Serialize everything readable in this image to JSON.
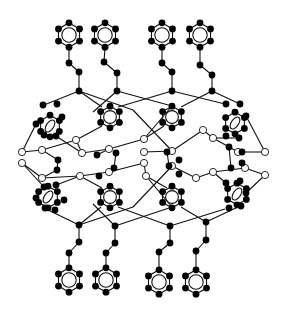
{
  "diagram": {
    "title": "",
    "width": 287,
    "height": 312,
    "colors": {
      "bond": "#111111",
      "filled_atom": "#000000",
      "open_atom": "#ffffff"
    },
    "benzene_rings": [
      {
        "id": "top1",
        "cx": 69,
        "cy": 35,
        "r": 9
      },
      {
        "id": "top2",
        "cx": 105,
        "cy": 35,
        "r": 9
      },
      {
        "id": "top3",
        "cx": 162,
        "cy": 35,
        "r": 9
      },
      {
        "id": "top4",
        "cx": 200,
        "cy": 35,
        "r": 9
      },
      {
        "id": "up-L",
        "cx": 50,
        "cy": 126,
        "r": 8,
        "tilt": true
      },
      {
        "id": "up-C1",
        "cx": 110,
        "cy": 117,
        "r": 8
      },
      {
        "id": "up-C2",
        "cx": 172,
        "cy": 117,
        "r": 8
      },
      {
        "id": "up-R",
        "cx": 235,
        "cy": 123,
        "r": 8,
        "tilt": true
      },
      {
        "id": "lo-L",
        "cx": 48,
        "cy": 197,
        "r": 8,
        "tilt": true
      },
      {
        "id": "lo-C1",
        "cx": 110,
        "cy": 197,
        "r": 8
      },
      {
        "id": "lo-C2",
        "cx": 172,
        "cy": 197,
        "r": 8
      },
      {
        "id": "lo-R",
        "cx": 237,
        "cy": 194,
        "r": 8,
        "tilt": true
      },
      {
        "id": "bot1",
        "cx": 69,
        "cy": 280,
        "r": 9
      },
      {
        "id": "bot2",
        "cx": 106,
        "cy": 280,
        "r": 9
      },
      {
        "id": "bot3",
        "cx": 159,
        "cy": 282,
        "r": 9
      },
      {
        "id": "bot4",
        "cx": 196,
        "cy": 282,
        "r": 9
      }
    ],
    "chains": [
      [
        [
          69,
          48
        ],
        [
          69,
          63
        ],
        [
          79,
          72
        ],
        [
          79,
          91
        ]
      ],
      [
        [
          105,
          48
        ],
        [
          104,
          62
        ],
        [
          117,
          73
        ],
        [
          117,
          91
        ]
      ],
      [
        [
          162,
          48
        ],
        [
          162,
          63
        ],
        [
          172,
          72
        ],
        [
          172,
          91
        ]
      ],
      [
        [
          200,
          48
        ],
        [
          200,
          65
        ],
        [
          212,
          75
        ],
        [
          212,
          91
        ]
      ],
      [
        [
          69,
          267
        ],
        [
          69,
          253
        ],
        [
          79,
          242
        ],
        [
          79,
          225
        ]
      ],
      [
        [
          106,
          267
        ],
        [
          106,
          253
        ],
        [
          115,
          243
        ],
        [
          115,
          226
        ]
      ],
      [
        [
          159,
          269
        ],
        [
          159,
          252
        ],
        [
          170,
          243
        ],
        [
          170,
          226
        ]
      ],
      [
        [
          196,
          269
        ],
        [
          196,
          251
        ],
        [
          206,
          240
        ],
        [
          206,
          222
        ]
      ]
    ],
    "open_atoms": [
      [
        22,
        152
      ],
      [
        42,
        150
      ],
      [
        76,
        140
      ],
      [
        82,
        153
      ],
      [
        109,
        149
      ],
      [
        144,
        139
      ],
      [
        144,
        152
      ],
      [
        172,
        151
      ],
      [
        203,
        130
      ],
      [
        213,
        138
      ],
      [
        238,
        152
      ],
      [
        265,
        152
      ],
      [
        22,
        163
      ],
      [
        42,
        178
      ],
      [
        80,
        176
      ],
      [
        109,
        172
      ],
      [
        144,
        163
      ],
      [
        146,
        176
      ],
      [
        172,
        166
      ],
      [
        196,
        178
      ],
      [
        213,
        172
      ],
      [
        245,
        168
      ],
      [
        265,
        175
      ]
    ],
    "filled_atoms": [
      [
        43,
        105
      ],
      [
        57,
        104
      ],
      [
        62,
        117
      ],
      [
        36,
        124
      ],
      [
        44,
        135
      ],
      [
        56,
        136
      ],
      [
        58,
        160
      ],
      [
        57,
        170
      ],
      [
        97,
        155
      ],
      [
        116,
        153
      ],
      [
        99,
        176
      ],
      [
        114,
        168
      ],
      [
        167,
        152
      ],
      [
        179,
        160
      ],
      [
        169,
        166
      ],
      [
        179,
        174
      ],
      [
        229,
        147
      ],
      [
        242,
        152
      ],
      [
        231,
        168
      ],
      [
        242,
        163
      ],
      [
        226,
        104
      ],
      [
        240,
        104
      ],
      [
        246,
        116
      ],
      [
        226,
        136
      ],
      [
        239,
        138
      ],
      [
        44,
        187
      ],
      [
        56,
        185
      ],
      [
        36,
        198
      ],
      [
        45,
        208
      ],
      [
        55,
        210
      ],
      [
        64,
        200
      ],
      [
        226,
        183
      ],
      [
        240,
        181
      ],
      [
        246,
        193
      ],
      [
        229,
        208
      ],
      [
        241,
        206
      ]
    ],
    "framework_bonds": [
      [
        [
          79,
          91
        ],
        [
          44,
          105
        ]
      ],
      [
        [
          79,
          91
        ],
        [
          102,
          107
        ]
      ],
      [
        [
          79,
          91
        ],
        [
          133,
          110
        ]
      ],
      [
        [
          117,
          91
        ],
        [
          93,
          112
        ]
      ],
      [
        [
          117,
          91
        ],
        [
          172,
          106
        ]
      ],
      [
        [
          172,
          91
        ],
        [
          118,
          107
        ]
      ],
      [
        [
          172,
          91
        ],
        [
          225,
          104
        ]
      ],
      [
        [
          212,
          91
        ],
        [
          181,
          107
        ]
      ],
      [
        [
          212,
          91
        ],
        [
          240,
          104
        ]
      ],
      [
        [
          79,
          225
        ],
        [
          44,
          208
        ]
      ],
      [
        [
          79,
          225
        ],
        [
          101,
          207
        ]
      ],
      [
        [
          79,
          225
        ],
        [
          133,
          207
        ]
      ],
      [
        [
          115,
          226
        ],
        [
          93,
          204
        ]
      ],
      [
        [
          115,
          226
        ],
        [
          172,
          207
        ]
      ],
      [
        [
          170,
          226
        ],
        [
          118,
          207
        ]
      ],
      [
        [
          170,
          226
        ],
        [
          225,
          209
        ]
      ],
      [
        [
          206,
          222
        ],
        [
          181,
          207
        ]
      ],
      [
        [
          206,
          222
        ],
        [
          240,
          206
        ]
      ],
      [
        [
          22,
          152
        ],
        [
          36,
          124
        ]
      ],
      [
        [
          22,
          152
        ],
        [
          42,
          150
        ]
      ],
      [
        [
          42,
          150
        ],
        [
          58,
          160
        ]
      ],
      [
        [
          42,
          150
        ],
        [
          76,
          140
        ]
      ],
      [
        [
          76,
          140
        ],
        [
          102,
          126
        ]
      ],
      [
        [
          76,
          140
        ],
        [
          82,
          153
        ]
      ],
      [
        [
          82,
          153
        ],
        [
          109,
          149
        ]
      ],
      [
        [
          109,
          149
        ],
        [
          144,
          139
        ]
      ],
      [
        [
          144,
          139
        ],
        [
          164,
          126
        ]
      ],
      [
        [
          144,
          152
        ],
        [
          172,
          151
        ]
      ],
      [
        [
          109,
          149
        ],
        [
          97,
          155
        ]
      ],
      [
        [
          172,
          151
        ],
        [
          203,
          130
        ]
      ],
      [
        [
          203,
          130
        ],
        [
          213,
          138
        ]
      ],
      [
        [
          213,
          138
        ],
        [
          238,
          152
        ]
      ],
      [
        [
          238,
          152
        ],
        [
          265,
          152
        ]
      ],
      [
        [
          265,
          152
        ],
        [
          246,
          116
        ]
      ],
      [
        [
          22,
          163
        ],
        [
          42,
          178
        ]
      ],
      [
        [
          22,
          163
        ],
        [
          44,
          187
        ]
      ],
      [
        [
          42,
          178
        ],
        [
          57,
          170
        ]
      ],
      [
        [
          42,
          178
        ],
        [
          80,
          176
        ]
      ],
      [
        [
          80,
          176
        ],
        [
          109,
          172
        ]
      ],
      [
        [
          80,
          176
        ],
        [
          102,
          188
        ]
      ],
      [
        [
          109,
          172
        ],
        [
          144,
          163
        ]
      ],
      [
        [
          144,
          163
        ],
        [
          146,
          176
        ]
      ],
      [
        [
          146,
          176
        ],
        [
          167,
          188
        ]
      ],
      [
        [
          172,
          166
        ],
        [
          196,
          178
        ]
      ],
      [
        [
          196,
          178
        ],
        [
          213,
          172
        ]
      ],
      [
        [
          213,
          172
        ],
        [
          245,
          168
        ]
      ],
      [
        [
          245,
          168
        ],
        [
          265,
          175
        ]
      ],
      [
        [
          265,
          175
        ],
        [
          246,
          193
        ]
      ],
      [
        [
          58,
          160
        ],
        [
          57,
          170
        ]
      ],
      [
        [
          229,
          147
        ],
        [
          231,
          168
        ]
      ],
      [
        [
          116,
          153
        ],
        [
          114,
          168
        ]
      ],
      [
        [
          167,
          152
        ],
        [
          169,
          166
        ]
      ],
      [
        [
          56,
          136
        ],
        [
          82,
          153
        ]
      ],
      [
        [
          239,
          138
        ],
        [
          213,
          138
        ]
      ],
      [
        [
          56,
          185
        ],
        [
          80,
          176
        ]
      ],
      [
        [
          226,
          183
        ],
        [
          213,
          172
        ]
      ],
      [
        [
          133,
          110
        ],
        [
          172,
          151
        ]
      ],
      [
        [
          172,
          106
        ],
        [
          144,
          139
        ]
      ],
      [
        [
          133,
          207
        ],
        [
          172,
          166
        ]
      ],
      [
        [
          172,
          207
        ],
        [
          146,
          176
        ]
      ]
    ]
  }
}
